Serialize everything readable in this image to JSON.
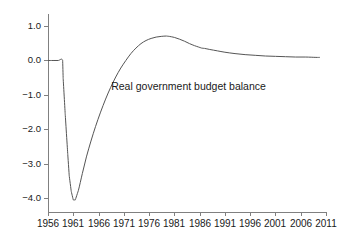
{
  "chart_data": {
    "type": "line",
    "title": "",
    "subtitle": "",
    "xlabel": "",
    "ylabel": "",
    "grid": false,
    "legend_position": "inline-annotation",
    "xlim": [
      1956,
      2011
    ],
    "ylim": [
      -4.4,
      1.35
    ],
    "xticks": [
      1956,
      1961,
      1966,
      1971,
      1976,
      1981,
      1986,
      1991,
      1996,
      2001,
      2006,
      2011
    ],
    "xtick_labels": [
      "1956",
      "1961",
      "1966",
      "1971",
      "1976",
      "1981",
      "1986",
      "1991",
      "1996",
      "2001",
      "2006",
      "2011"
    ],
    "yticks": [
      1.0,
      0.0,
      -1.0,
      -2.0,
      -3.0,
      -4.0
    ],
    "ytick_labels": [
      "1.0",
      "0.0",
      "−1.0",
      "−2.0",
      "−3.0",
      "−4.0"
    ],
    "annotations": [
      {
        "text": "Real government budget balance",
        "x": 1968.5,
        "y": -0.62
      }
    ],
    "series": [
      {
        "name": "Real government budget balance",
        "color": "#555555",
        "x": [
          1956.0,
          1957.0,
          1958.0,
          1958.9,
          1959.0,
          1959.4,
          1959.9,
          1960.2,
          1960.6,
          1961.0,
          1961.4,
          1962.0,
          1962.8,
          1963.6,
          1964.5,
          1965.4,
          1966.4,
          1967.4,
          1968.4,
          1969.4,
          1970.4,
          1971.4,
          1972.4,
          1973.4,
          1974.4,
          1975.4,
          1976.4,
          1977.4,
          1978.4,
          1979.4,
          1980.0,
          1981.0,
          1982.0,
          1983.0,
          1984.0,
          1985.0,
          1985.8,
          1986.4,
          1987.0,
          1988.0,
          1989.5,
          1991.0,
          1993.0,
          1995.0,
          1997.0,
          1999.0,
          2001.0,
          2003.0,
          2005.0,
          2007.0,
          2009.0,
          2009.8
        ],
        "y": [
          0.0,
          0.0,
          0.0,
          0.0,
          -0.52,
          -1.55,
          -2.7,
          -3.35,
          -3.8,
          -4.05,
          -4.05,
          -3.78,
          -3.28,
          -2.8,
          -2.34,
          -1.92,
          -1.5,
          -1.12,
          -0.78,
          -0.48,
          -0.22,
          0.0,
          0.2,
          0.36,
          0.49,
          0.58,
          0.64,
          0.68,
          0.7,
          0.71,
          0.7,
          0.67,
          0.62,
          0.56,
          0.49,
          0.43,
          0.39,
          0.36,
          0.35,
          0.32,
          0.28,
          0.24,
          0.2,
          0.17,
          0.15,
          0.13,
          0.12,
          0.11,
          0.1,
          0.1,
          0.09,
          0.09
        ]
      }
    ]
  },
  "geometry": {
    "plot_left": 48,
    "plot_right": 326,
    "plot_top": 14,
    "plot_bottom": 212,
    "x_min": 1956,
    "x_max": 2011,
    "y_min": -4.4,
    "y_max": 1.35
  }
}
